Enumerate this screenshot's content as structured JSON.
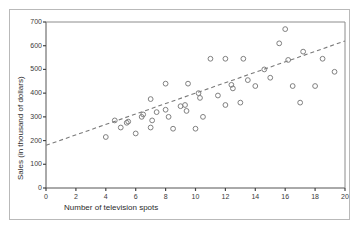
{
  "chart_data": {
    "type": "scatter",
    "title": "",
    "xlabel": "Number of television spots",
    "ylabel": "Sales (in thousand of dollars)",
    "xlim": [
      0,
      20
    ],
    "ylim": [
      0,
      700
    ],
    "xticks": [
      0,
      2,
      4,
      6,
      8,
      10,
      12,
      14,
      16,
      18,
      20
    ],
    "yticks": [
      0,
      100,
      200,
      300,
      400,
      500,
      600,
      700
    ],
    "grid": false,
    "legend": null,
    "marker": "open-circle",
    "marker_color": "#808080",
    "trendline": {
      "style": "dashed",
      "color": "#7a7a7a",
      "x": [
        0,
        20
      ],
      "y": [
        180,
        620
      ],
      "intercept": 180,
      "slope": 22
    },
    "points": [
      {
        "x": 4.0,
        "y": 215
      },
      {
        "x": 4.6,
        "y": 285
      },
      {
        "x": 5.0,
        "y": 255
      },
      {
        "x": 5.4,
        "y": 275
      },
      {
        "x": 5.5,
        "y": 280
      },
      {
        "x": 6.0,
        "y": 230
      },
      {
        "x": 6.4,
        "y": 300
      },
      {
        "x": 6.5,
        "y": 310
      },
      {
        "x": 7.0,
        "y": 375
      },
      {
        "x": 7.0,
        "y": 255
      },
      {
        "x": 7.1,
        "y": 285
      },
      {
        "x": 7.4,
        "y": 320
      },
      {
        "x": 8.0,
        "y": 330
      },
      {
        "x": 8.0,
        "y": 440
      },
      {
        "x": 8.2,
        "y": 300
      },
      {
        "x": 8.5,
        "y": 250
      },
      {
        "x": 9.0,
        "y": 345
      },
      {
        "x": 9.3,
        "y": 350
      },
      {
        "x": 9.4,
        "y": 325
      },
      {
        "x": 9.5,
        "y": 440
      },
      {
        "x": 10.0,
        "y": 250
      },
      {
        "x": 10.2,
        "y": 400
      },
      {
        "x": 10.3,
        "y": 380
      },
      {
        "x": 10.5,
        "y": 300
      },
      {
        "x": 11.0,
        "y": 545
      },
      {
        "x": 11.5,
        "y": 390
      },
      {
        "x": 12.0,
        "y": 545
      },
      {
        "x": 12.0,
        "y": 350
      },
      {
        "x": 12.4,
        "y": 435
      },
      {
        "x": 12.5,
        "y": 420
      },
      {
        "x": 13.0,
        "y": 360
      },
      {
        "x": 13.2,
        "y": 545
      },
      {
        "x": 13.5,
        "y": 455
      },
      {
        "x": 14.0,
        "y": 430
      },
      {
        "x": 14.6,
        "y": 500
      },
      {
        "x": 15.0,
        "y": 465
      },
      {
        "x": 15.6,
        "y": 610
      },
      {
        "x": 16.0,
        "y": 670
      },
      {
        "x": 16.2,
        "y": 540
      },
      {
        "x": 16.5,
        "y": 430
      },
      {
        "x": 17.0,
        "y": 360
      },
      {
        "x": 17.2,
        "y": 575
      },
      {
        "x": 18.0,
        "y": 430
      },
      {
        "x": 18.5,
        "y": 545
      },
      {
        "x": 19.3,
        "y": 490
      }
    ]
  }
}
